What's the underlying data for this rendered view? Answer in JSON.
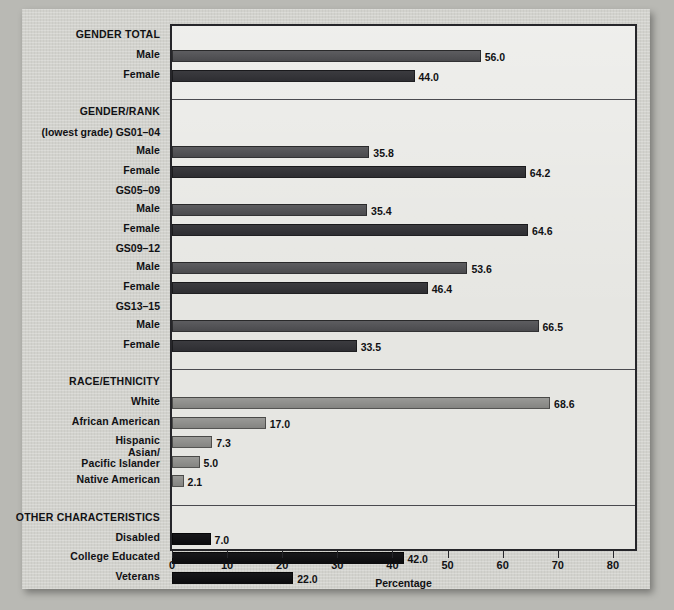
{
  "chart_data": {
    "type": "bar",
    "orientation": "horizontal",
    "title": "",
    "xlabel": "Percentage",
    "ylabel": "",
    "xlim": [
      0,
      84
    ],
    "grid": false,
    "legend": "none",
    "axis": {
      "ticks": [
        0,
        10,
        20,
        30,
        40,
        50,
        60,
        70,
        80
      ],
      "tick_labels": [
        "0",
        "10",
        "20",
        "30",
        "40",
        "50",
        "60",
        "70",
        "80"
      ]
    },
    "sections": [
      {
        "heading": "GENDER TOTAL",
        "groups": [
          {
            "group_label": "",
            "rows": [
              {
                "label": "Male",
                "value": 56.0,
                "value_label": "56.0",
                "series": "male"
              },
              {
                "label": "Female",
                "value": 44.0,
                "value_label": "44.0",
                "series": "female"
              }
            ]
          }
        ]
      },
      {
        "heading": "GENDER/RANK",
        "groups": [
          {
            "group_label": "(lowest grade) GS01–04",
            "rows": [
              {
                "label": "Male",
                "value": 35.8,
                "value_label": "35.8",
                "series": "male"
              },
              {
                "label": "Female",
                "value": 64.2,
                "value_label": "64.2",
                "series": "female"
              }
            ]
          },
          {
            "group_label": "GS05–09",
            "rows": [
              {
                "label": "Male",
                "value": 35.4,
                "value_label": "35.4",
                "series": "male"
              },
              {
                "label": "Female",
                "value": 64.6,
                "value_label": "64.6",
                "series": "female"
              }
            ]
          },
          {
            "group_label": "GS09–12",
            "rows": [
              {
                "label": "Male",
                "value": 53.6,
                "value_label": "53.6",
                "series": "male"
              },
              {
                "label": "Female",
                "value": 46.4,
                "value_label": "46.4",
                "series": "female"
              }
            ]
          },
          {
            "group_label": "GS13–15",
            "rows": [
              {
                "label": "Male",
                "value": 66.5,
                "value_label": "66.5",
                "series": "male"
              },
              {
                "label": "Female",
                "value": 33.5,
                "value_label": "33.5",
                "series": "female"
              }
            ]
          }
        ]
      },
      {
        "heading": "RACE/ETHNICITY",
        "groups": [
          {
            "group_label": "",
            "rows": [
              {
                "label": "White",
                "value": 68.6,
                "value_label": "68.6",
                "series": "race"
              },
              {
                "label": "African American",
                "value": 17.0,
                "value_label": "17.0",
                "series": "race"
              },
              {
                "label": "Hispanic",
                "value": 7.3,
                "value_label": "7.3",
                "series": "race"
              },
              {
                "label": "Asian/\nPacific Islander",
                "value": 5.0,
                "value_label": "5.0",
                "series": "race"
              },
              {
                "label": "Native American",
                "value": 2.1,
                "value_label": "2.1",
                "series": "race"
              }
            ]
          }
        ]
      },
      {
        "heading": "OTHER CHARACTERISTICS",
        "groups": [
          {
            "group_label": "",
            "rows": [
              {
                "label": "Disabled",
                "value": 7.0,
                "value_label": "7.0",
                "series": "other"
              },
              {
                "label": "College Educated",
                "value": 42.0,
                "value_label": "42.0",
                "series": "other"
              },
              {
                "label": "Veterans",
                "value": 22.0,
                "value_label": "22.0",
                "series": "other"
              }
            ]
          }
        ]
      }
    ],
    "series_colors": {
      "male": "#4f4f52",
      "female": "#343438",
      "race": "#8f8f8c",
      "other": "#121215"
    }
  },
  "figure": {
    "axis_title": "Percentage",
    "section_headings": [
      "GENDER TOTAL",
      "GENDER/RANK",
      "RACE/ETHNICITY",
      "OTHER CHARACTERISTICS"
    ],
    "paper_color": "#d2d2cd",
    "plot_bg_color": "#e6e6e2",
    "frame_color": "#26262a",
    "page_bg_color": "#b9b9b4"
  }
}
